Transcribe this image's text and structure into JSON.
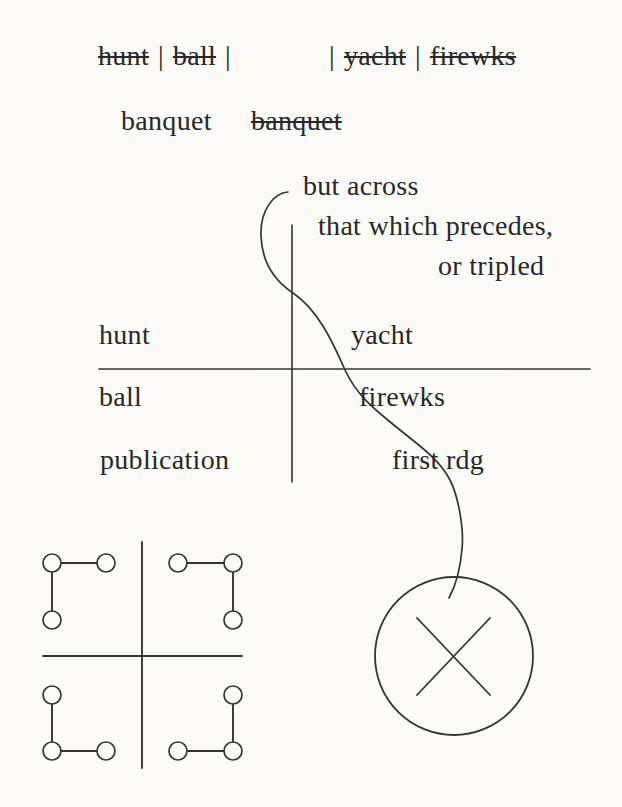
{
  "palette": {
    "paper": "#fbfaf7",
    "ink": "#282828",
    "line": "#343434"
  },
  "scratch_line": {
    "word_hunt": "hunt",
    "pipe_a": "|",
    "word_ball": "ball",
    "pipe_b": "|",
    "pipe_c": "|",
    "word_yacht": "yacht",
    "pipe_d": "|",
    "word_firewks": "firewks"
  },
  "banquet_row": {
    "kept": "banquet",
    "struck": "banquet"
  },
  "notes": {
    "but_across": "but across",
    "that_which_precedes": "that which precedes,",
    "or_tripled": "or tripled"
  },
  "quadrant_labels": {
    "top_left": "hunt",
    "top_right": "yacht",
    "mid_left": "ball",
    "mid_right": "firewks",
    "bottom_left": "publication",
    "bottom_right": "first rdg"
  }
}
